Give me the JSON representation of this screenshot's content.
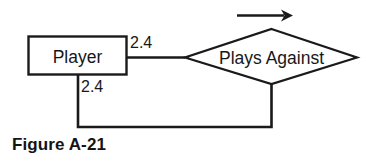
{
  "figure": {
    "caption": "Figure A-21",
    "background_color": "#ffffff",
    "stroke_color": "#1a1a1d",
    "text_color": "#17171a"
  },
  "diagram": {
    "type": "entity-relationship-diagram",
    "entity": {
      "label": "Player",
      "shape": "rectangle"
    },
    "relationship": {
      "label": "Plays Against",
      "shape": "diamond",
      "recursive": true,
      "direction_marker": "arrow-right"
    },
    "cardinalities": [
      {
        "id": "upper",
        "label": "2.4"
      },
      {
        "id": "lower",
        "label": "2.4"
      }
    ]
  }
}
